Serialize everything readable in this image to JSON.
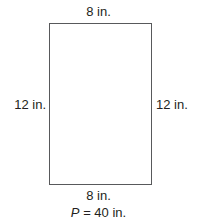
{
  "figure": {
    "type": "rectangle",
    "shape_name": "rectangle",
    "stroke_color": "#58595b",
    "fill_color": "#ffffff",
    "text_color": "#231f20",
    "background_color": "#ffffff"
  },
  "labels": {
    "top": "8 in.",
    "bottom": "8 in.",
    "left": "12 in.",
    "right": "12 in."
  },
  "perimeter": {
    "symbol": "P",
    "equals_and_value": "= 40 in.",
    "full_text": "P = 40 in.",
    "value": 40,
    "unit": "in."
  },
  "chart_data": {
    "type": "diagram",
    "shape": "rectangle",
    "title": "",
    "dimensions": {
      "width": 8,
      "height": 12,
      "unit": "in."
    },
    "side_labels": [
      {
        "side": "top",
        "text": "8 in.",
        "value": 8
      },
      {
        "side": "right",
        "text": "12 in.",
        "value": 12
      },
      {
        "side": "bottom",
        "text": "8 in.",
        "value": 8
      },
      {
        "side": "left",
        "text": "12 in.",
        "value": 12
      }
    ],
    "annotations": [
      {
        "name": "perimeter",
        "text": "P = 40 in.",
        "value": 40,
        "unit": "in."
      }
    ]
  }
}
